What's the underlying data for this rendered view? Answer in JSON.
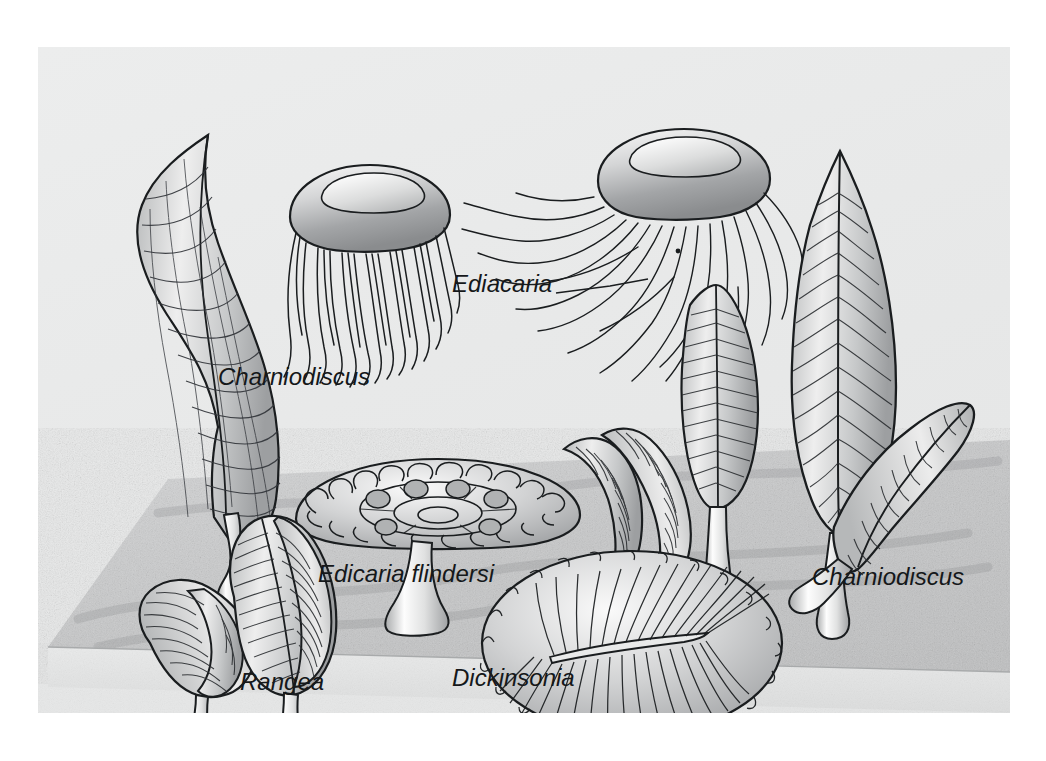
{
  "figure": {
    "kind": "scientific-illustration",
    "panel": {
      "background_color": "#e9eaea",
      "outer_margin_color": "#ffffff",
      "left": 38,
      "top": 47,
      "width": 972,
      "height": 666
    },
    "seafloor": {
      "name": "seafloor-slab",
      "description": "stippled sandy sediment slab drawn in oblique perspective",
      "top_color": "#c9cacb",
      "front_face_color": "#e3e4e4",
      "texture": "fine random stipple grain"
    },
    "ink_color": "#1a1d1f",
    "body_fill_light": "#f2f2f2",
    "body_fill_mid": "#c8c9ca",
    "body_fill_dark": "#9a9b9d"
  },
  "labels": [
    {
      "id": "charniodiscus-left",
      "text": "Charniodiscus",
      "x": 218,
      "y": 385,
      "size": 24,
      "leader": false
    },
    {
      "id": "ediacaria",
      "text": "Ediacaria",
      "x": 452,
      "y": 292,
      "size": 24,
      "leader": true,
      "leader_path": "M 556 284 L 610 277 L 648 270"
    },
    {
      "id": "edicaria-flindersi",
      "text": "Edicaria flindersi",
      "x": 318,
      "y": 582,
      "size": 24,
      "leader": false
    },
    {
      "id": "rangea",
      "text": "Rangea",
      "x": 240,
      "y": 690,
      "size": 24,
      "leader": false
    },
    {
      "id": "dickinsonia",
      "text": "Dickinsonia",
      "x": 452,
      "y": 686,
      "size": 24,
      "leader": false
    },
    {
      "id": "charniodiscus-right",
      "text": "Charniodiscus",
      "x": 812,
      "y": 585,
      "size": 24,
      "leader": false
    }
  ],
  "organisms": [
    {
      "id": "charniodiscus-left-frond",
      "common_name": "Charniodiscus",
      "form": "tall curved cross-hatched frond on bulbous holdfast",
      "position": "upper left"
    },
    {
      "id": "ediacaria-jelly-left",
      "common_name": "Ediacaria",
      "form": "domed medusa bell with ~20 straight trailing tentacles",
      "position": "top center-left"
    },
    {
      "id": "ediacaria-jelly-right",
      "common_name": "Ediacaria",
      "form": "domed medusa bell with long wavy tentacles streaming left",
      "position": "top center-right"
    },
    {
      "id": "edicaria-flindersi-disc",
      "common_name": "Edicaria flindersi",
      "form": "umbrella disc with concentric rings, oval nodes and radial fringe on short stalk",
      "position": "center left"
    },
    {
      "id": "dickinsonia-oval",
      "common_name": "Dickinsonia",
      "form": "flat oval body with many radiating segments about a central axial ridge",
      "position": "bottom center"
    },
    {
      "id": "rangea-frond-small",
      "common_name": "Rangea",
      "form": "small leaf frond, folded vanes, fine transverse ribs",
      "position": "bottom left"
    },
    {
      "id": "rangea-frond-large",
      "common_name": "Rangea",
      "form": "leaf frond with central rachis and dense ribs on stout stalk",
      "position": "bottom left"
    },
    {
      "id": "charniodiscus-mid-a",
      "common_name": "Charniodiscus",
      "form": "slender recurved frond with chevron ribs",
      "position": "center"
    },
    {
      "id": "charniodiscus-mid-b",
      "common_name": "Charniodiscus",
      "form": "slender recurved frond with chevron ribs",
      "position": "center"
    },
    {
      "id": "charniodiscus-mid-upright",
      "common_name": "Charniodiscus",
      "form": "narrow lanceolate ribbed frond, upright",
      "position": "center"
    },
    {
      "id": "charniodiscus-right-tall",
      "common_name": "Charniodiscus",
      "form": "large leaf-shaped frond, horizontal ribs, long stem",
      "position": "right"
    },
    {
      "id": "charniodiscus-right-curved",
      "common_name": "Charniodiscus",
      "form": "sickle-shaped ribbed frond curving up-right",
      "position": "right lower"
    }
  ]
}
